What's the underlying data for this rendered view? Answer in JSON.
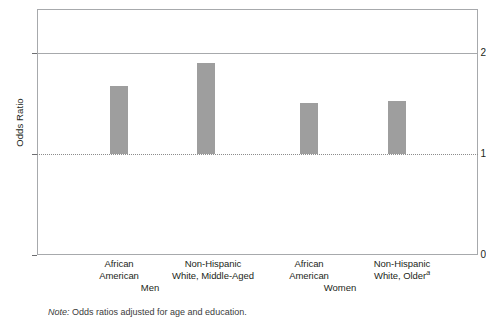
{
  "chart_data": {
    "type": "bar",
    "title": "",
    "xlabel": "",
    "ylabel": "Odds Ratio",
    "ylim": [
      0,
      2.44
    ],
    "yticks": [
      0,
      1,
      2
    ],
    "ytick_labels": [
      "0",
      "1",
      "2"
    ],
    "gridlines": [
      2
    ],
    "reference_line": {
      "value": 1,
      "style": "dotted"
    },
    "grid": false,
    "legend": "none",
    "bar_color": "#9e9e9e",
    "bar_baseline": 1,
    "categories": [
      "African American",
      "Non-Hispanic White, Middle-Aged",
      "African American",
      "Non-Hispanic White, Older"
    ],
    "values": [
      1.68,
      1.9,
      1.51,
      1.53
    ],
    "groups": [
      "Men",
      "Women"
    ],
    "group_membership": [
      0,
      0,
      1,
      1
    ]
  },
  "axis": {
    "y_title": "Odds Ratio",
    "ticks": [
      {
        "label": "2",
        "value": 2
      },
      {
        "label": "1",
        "value": 1
      },
      {
        "label": "0",
        "value": 0
      }
    ]
  },
  "categories": [
    {
      "line1": "African",
      "line2": "American",
      "sup": ""
    },
    {
      "line1": "Non-Hispanic",
      "line2": "White, Middle-Aged",
      "sup": ""
    },
    {
      "line1": "African",
      "line2": "American",
      "sup": ""
    },
    {
      "line1": "Non-Hispanic",
      "line2": "White, Older",
      "sup": "a"
    }
  ],
  "groups": [
    {
      "label": "Men"
    },
    {
      "label": "Women"
    }
  ],
  "note": {
    "prefix": "Note:",
    "text": "Odds ratios adjusted for age and education."
  },
  "colors": {
    "bar": "#9e9e9e",
    "frame": "#a7a9ac",
    "gridline": "#a7a9ac",
    "refline": "#8c8c8c",
    "text": "#231f20"
  }
}
